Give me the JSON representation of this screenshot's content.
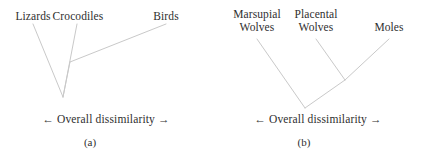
{
  "figure": {
    "width": 424,
    "height": 157,
    "background": "#ffffff",
    "line_color": "#c9c9c9",
    "text_color": "#2f2f2f"
  },
  "panels": [
    {
      "id": "a",
      "caption": "(a)",
      "axis_label": "← Overall dissimilarity →",
      "leaves": [
        {
          "label": "Lizards",
          "x": 33,
          "y": 12
        },
        {
          "label": "Crocodiles",
          "x": 77,
          "y": 12
        },
        {
          "label": "Birds",
          "x": 166,
          "y": 12
        },
        {
          "label": "",
          "x": 0,
          "y": 0
        }
      ],
      "leaf_labels": [
        "Lizards",
        "Crocodiles",
        "Birds"
      ],
      "segments": [
        {
          "name": "lizards-branch",
          "x1": 33,
          "y1": 24,
          "x2": 63,
          "y2": 97
        },
        {
          "name": "crocodiles-branch",
          "x1": 77,
          "y1": 24,
          "x2": 63,
          "y2": 97
        },
        {
          "name": "birds-branch",
          "x1": 166,
          "y1": 24,
          "x2": 70,
          "y2": 62
        },
        {
          "name": "inner-node-stem",
          "x1": 70,
          "y1": 62,
          "x2": 63,
          "y2": 97
        }
      ]
    },
    {
      "id": "b",
      "caption": "(b)",
      "axis_label": "← Overall dissimilarity →",
      "leaf_labels": [
        "Marsupial Wolves",
        "Placental Wolves",
        "Moles"
      ],
      "leaves": [
        {
          "label_line1": "Marsupial",
          "label_line2": "Wolves",
          "x": 45,
          "y": 8
        },
        {
          "label_line1": "Placental",
          "label_line2": "Wolves",
          "x": 104,
          "y": 8
        },
        {
          "label_line1": "Moles",
          "label_line2": "",
          "x": 177,
          "y": 21
        }
      ],
      "segments": [
        {
          "name": "marsupial-wolves-branch",
          "x1": 45,
          "y1": 39,
          "x2": 93,
          "y2": 108
        },
        {
          "name": "placental-wolves-branch",
          "x1": 104,
          "y1": 39,
          "x2": 133,
          "y2": 80
        },
        {
          "name": "moles-branch",
          "x1": 177,
          "y1": 39,
          "x2": 133,
          "y2": 80
        },
        {
          "name": "inner-node-stem",
          "x1": 133,
          "y1": 80,
          "x2": 93,
          "y2": 108
        }
      ]
    }
  ],
  "layout": {
    "axis_label_y": 118,
    "caption_y": 138
  }
}
